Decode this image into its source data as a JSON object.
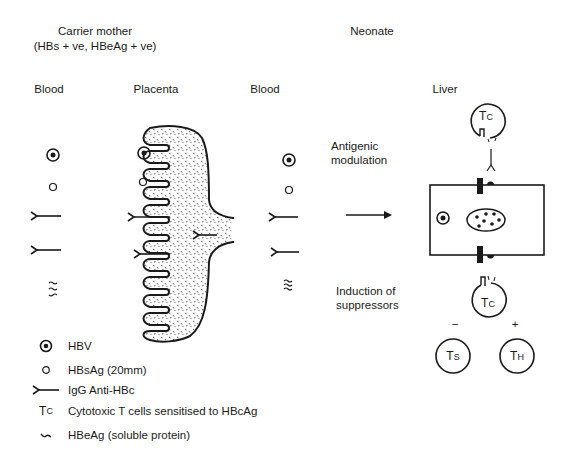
{
  "headers": {
    "mother_title": "Carrier mother",
    "mother_subtitle": "(HBs + ve, HBeAg + ve)",
    "neonate_title": "Neonate"
  },
  "columns": {
    "mother_blood": "Blood",
    "placenta": "Placenta",
    "neonate_blood": "Blood",
    "liver": "Liver"
  },
  "annotations": {
    "antigenic_1": "Antigenic",
    "antigenic_2": "modulation",
    "induction_1": "Induction of",
    "induction_2": "suppressors",
    "minus": "−",
    "plus": "+"
  },
  "cells": {
    "tc_main": "T",
    "tc_sub": "C",
    "ts_main": "T",
    "ts_sub": "S",
    "th_main": "T",
    "th_sub": "H"
  },
  "legend": {
    "items": [
      {
        "symbol": "hbv-icon",
        "label": "HBV"
      },
      {
        "symbol": "hbsag-icon",
        "label": "HBsAg (20mm)"
      },
      {
        "symbol": "igg-antibody-icon",
        "label": "IgG Anti-HBc"
      },
      {
        "symbol": "tc-symbol",
        "label": "Cytotoxic T cells sensitised to HBcAg"
      },
      {
        "symbol": "hbeag-wave-icon",
        "label": "HBeAg (soluble protein)"
      }
    ],
    "tc_main": "T",
    "tc_sub": "C"
  },
  "colors": {
    "ink": "#1a1a1a",
    "background": "#ffffff"
  }
}
